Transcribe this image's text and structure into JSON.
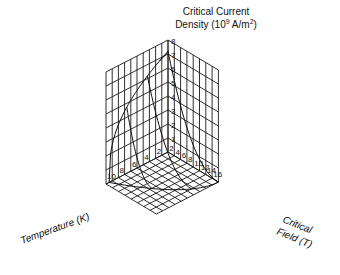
{
  "diagram": {
    "type": "3d-surface",
    "title_line1": "Critical Current",
    "title_line2_prefix": "Density (10",
    "title_line2_sup": "9",
    "title_line2_mid": " A/m",
    "title_line2_sup2": "2",
    "title_line2_suffix": ")",
    "x_axis_label": "Temperature (K)",
    "y_axis_label_line1": "Critical",
    "y_axis_label_line2": "Field (T)",
    "z_ticks": [
      "1",
      "2",
      "3",
      "4",
      "5",
      "6",
      "7",
      "8"
    ],
    "temperature_ticks": [
      "2",
      "4",
      "6",
      "8",
      "10"
    ],
    "field_ticks": [
      "2",
      "4",
      "6",
      "8",
      "10",
      "12",
      "14",
      "16"
    ],
    "line_color": "#1a1a1a",
    "background": "#ffffff"
  }
}
